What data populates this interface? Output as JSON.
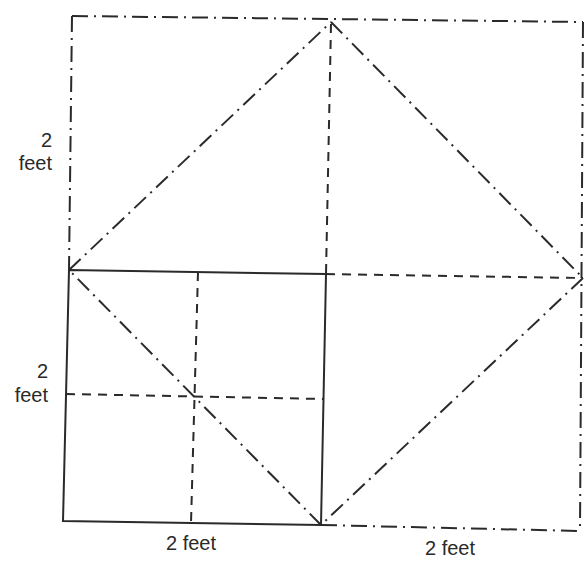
{
  "diagram": {
    "labels": {
      "left_upper_number": "2",
      "left_upper_unit": "feet",
      "left_lower_number": "2",
      "left_lower_unit": "feet",
      "bottom_left": "2 feet",
      "bottom_right": "2 feet"
    },
    "points": {
      "outer_top_left": [
        72,
        16
      ],
      "outer_top_right": [
        583,
        22
      ],
      "outer_bottom_right": [
        580,
        531
      ],
      "top_vertex": [
        331,
        22
      ],
      "right_vertex": [
        583,
        278
      ],
      "bottom_vertex": [
        321,
        525
      ],
      "left_vertex": [
        69,
        270
      ],
      "solid_top_left": [
        69,
        270
      ],
      "solid_top_right": [
        326,
        274
      ],
      "solid_bottom_right": [
        321,
        525
      ],
      "solid_bottom_left": [
        63,
        521
      ],
      "center": [
        194,
        396
      ]
    },
    "colors": {
      "stroke": "#2a2a2a",
      "background": "#ffffff"
    },
    "line_styles": {
      "solid": "original 2x2 square",
      "dashed": "midlines / 1-ft grid extensions",
      "dash_dot": "outer 4x4 square and diagonal (rotated) square"
    }
  }
}
